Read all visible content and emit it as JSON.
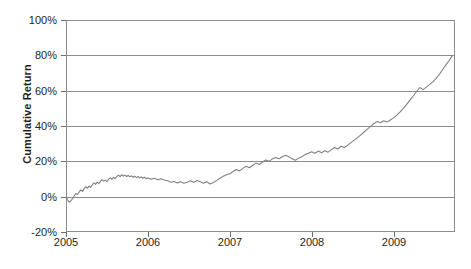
{
  "chart_data": {
    "type": "line",
    "title": "",
    "xlabel": "",
    "ylabel": "Cumulative Return",
    "xlim": [
      2005.0,
      2009.75
    ],
    "ylim": [
      -20,
      100
    ],
    "grid": true,
    "legend": "none",
    "y_tick_labels": [
      "100%",
      "80%",
      "60%",
      "40%",
      "20%",
      "0%",
      "-20%"
    ],
    "y_tick_values": [
      100,
      80,
      60,
      40,
      20,
      0,
      -20
    ],
    "x_tick_labels": [
      "2005",
      "2006",
      "2007",
      "2008",
      "2009"
    ],
    "x_tick_values": [
      2005,
      2006,
      2007,
      2008,
      2009
    ],
    "line_color": "#808080",
    "series": [
      {
        "name": "Cumulative Return",
        "x": [
          2005.0,
          2005.02,
          2005.04,
          2005.06,
          2005.08,
          2005.1,
          2005.12,
          2005.14,
          2005.16,
          2005.18,
          2005.2,
          2005.22,
          2005.24,
          2005.26,
          2005.28,
          2005.3,
          2005.32,
          2005.34,
          2005.36,
          2005.38,
          2005.4,
          2005.42,
          2005.44,
          2005.46,
          2005.48,
          2005.5,
          2005.52,
          2005.54,
          2005.56,
          2005.58,
          2005.6,
          2005.62,
          2005.64,
          2005.66,
          2005.68,
          2005.7,
          2005.72,
          2005.74,
          2005.76,
          2005.78,
          2005.8,
          2005.82,
          2005.84,
          2005.86,
          2005.88,
          2005.9,
          2005.92,
          2005.94,
          2005.96,
          2005.98,
          2006.0,
          2006.04,
          2006.08,
          2006.12,
          2006.16,
          2006.2,
          2006.24,
          2006.28,
          2006.32,
          2006.36,
          2006.4,
          2006.44,
          2006.48,
          2006.52,
          2006.56,
          2006.6,
          2006.64,
          2006.68,
          2006.72,
          2006.76,
          2006.8,
          2006.84,
          2006.88,
          2006.92,
          2006.96,
          2007.0,
          2007.04,
          2007.08,
          2007.12,
          2007.16,
          2007.2,
          2007.24,
          2007.28,
          2007.32,
          2007.36,
          2007.4,
          2007.44,
          2007.48,
          2007.52,
          2007.56,
          2007.6,
          2007.64,
          2007.68,
          2007.72,
          2007.76,
          2007.8,
          2007.84,
          2007.88,
          2007.92,
          2007.96,
          2008.0,
          2008.04,
          2008.08,
          2008.12,
          2008.16,
          2008.2,
          2008.24,
          2008.28,
          2008.32,
          2008.36,
          2008.4,
          2008.44,
          2008.48,
          2008.52,
          2008.56,
          2008.6,
          2008.64,
          2008.68,
          2008.72,
          2008.76,
          2008.8,
          2008.84,
          2008.88,
          2008.92,
          2008.96,
          2009.0,
          2009.04,
          2009.08,
          2009.12,
          2009.16,
          2009.2,
          2009.24,
          2009.28,
          2009.32,
          2009.36,
          2009.4,
          2009.44,
          2009.48,
          2009.52,
          2009.56,
          2009.6,
          2009.64,
          2009.68,
          2009.72
        ],
        "y": [
          0.0,
          -1.8,
          -3.2,
          -2.4,
          -1.0,
          0.5,
          1.8,
          1.2,
          2.6,
          3.8,
          3.0,
          4.4,
          5.6,
          4.8,
          6.0,
          5.2,
          6.6,
          7.8,
          7.0,
          8.2,
          7.4,
          8.6,
          9.6,
          8.8,
          9.4,
          8.6,
          9.8,
          10.6,
          9.8,
          11.0,
          10.2,
          11.4,
          12.2,
          11.4,
          12.4,
          11.6,
          12.2,
          11.4,
          12.0,
          11.2,
          11.8,
          11.0,
          11.6,
          10.8,
          11.4,
          10.6,
          11.2,
          10.4,
          11.0,
          10.2,
          10.6,
          9.8,
          10.4,
          9.6,
          10.2,
          9.4,
          9.0,
          8.2,
          8.6,
          7.8,
          8.4,
          7.6,
          8.2,
          9.0,
          8.2,
          9.2,
          8.4,
          7.6,
          8.4,
          7.2,
          8.0,
          9.2,
          10.4,
          11.6,
          12.4,
          13.0,
          14.2,
          15.4,
          14.6,
          16.0,
          17.2,
          16.4,
          17.8,
          19.0,
          18.2,
          19.6,
          20.8,
          20.0,
          21.4,
          22.2,
          21.4,
          22.6,
          23.4,
          22.6,
          21.4,
          20.6,
          21.8,
          22.6,
          23.8,
          24.6,
          25.4,
          24.6,
          25.8,
          24.8,
          26.0,
          25.2,
          26.6,
          27.8,
          27.0,
          28.6,
          27.8,
          29.2,
          30.6,
          32.0,
          33.4,
          35.0,
          36.6,
          38.2,
          39.8,
          41.4,
          42.6,
          41.8,
          43.0,
          42.2,
          43.4,
          44.6,
          46.2,
          48.0,
          50.0,
          52.2,
          54.6,
          57.0,
          59.4,
          61.8,
          60.6,
          62.0,
          63.4,
          65.0,
          67.0,
          69.4,
          72.0,
          74.6,
          77.2,
          80.0
        ]
      }
    ]
  },
  "axis": {
    "ylabel": "Cumulative Return"
  }
}
